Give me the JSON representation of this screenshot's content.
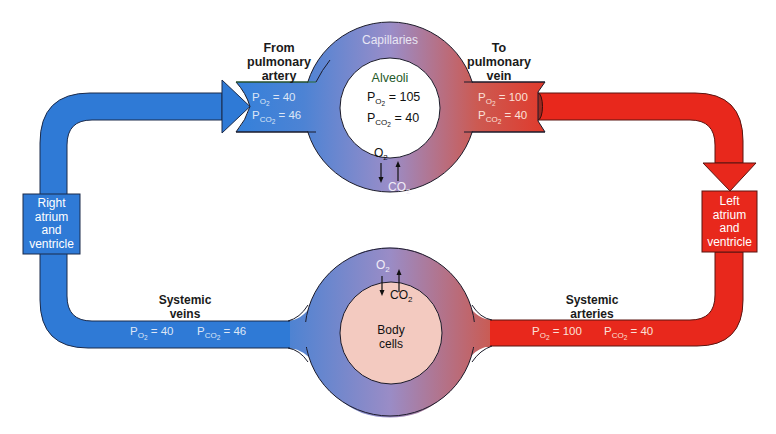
{
  "colors": {
    "venous_blue": "#2f7ad6",
    "arterial_red": "#e8281c",
    "mid_purple": "#9a8ac4",
    "body_cells_pink": "#f3cac0",
    "outline": "#1b1b2a",
    "label_green": "#1f5a2a"
  },
  "pulmonary": {
    "capillaries_label": "Capillaries",
    "from_label": [
      "From",
      "pulmonary",
      "artery"
    ],
    "to_label": [
      "To",
      "pulmonary",
      "vein"
    ],
    "alveoli": {
      "label": "Alveoli",
      "po2": {
        "symbol": "P",
        "sub": "O",
        "subsub": "2",
        "value": "= 105"
      },
      "pco2": {
        "symbol": "P",
        "sub": "CO",
        "subsub": "2",
        "value": "= 40"
      }
    },
    "inflow": {
      "po2": {
        "symbol": "P",
        "sub": "O",
        "subsub": "2",
        "value": "= 40"
      },
      "pco2": {
        "symbol": "P",
        "sub": "CO",
        "subsub": "2",
        "value": "= 46"
      }
    },
    "outflow": {
      "po2": {
        "symbol": "P",
        "sub": "O",
        "subsub": "2",
        "value": "= 100"
      },
      "pco2": {
        "symbol": "P",
        "sub": "CO",
        "subsub": "2",
        "value": "= 40"
      }
    },
    "exchange": {
      "o2": "O",
      "o2_sub": "2",
      "co2": "CO",
      "co2_sub": "2"
    }
  },
  "heart": {
    "right": [
      "Right",
      "atrium",
      "and",
      "ventricle"
    ],
    "left": [
      "Left",
      "atrium",
      "and",
      "ventricle"
    ]
  },
  "systemic": {
    "veins_label": [
      "Systemic",
      "veins"
    ],
    "arteries_label": [
      "Systemic",
      "arteries"
    ],
    "veins": {
      "po2": {
        "symbol": "P",
        "sub": "O",
        "subsub": "2",
        "value": "= 40"
      },
      "pco2": {
        "symbol": "P",
        "sub": "CO",
        "subsub": "2",
        "value": "= 46"
      }
    },
    "arteries": {
      "po2": {
        "symbol": "P",
        "sub": "O",
        "subsub": "2",
        "value": "= 100"
      },
      "pco2": {
        "symbol": "P",
        "sub": "CO",
        "subsub": "2",
        "value": "= 40"
      }
    },
    "body_cells": [
      "Body",
      "cells"
    ],
    "exchange": {
      "o2": "O",
      "o2_sub": "2",
      "co2": "CO",
      "co2_sub": "2"
    }
  }
}
